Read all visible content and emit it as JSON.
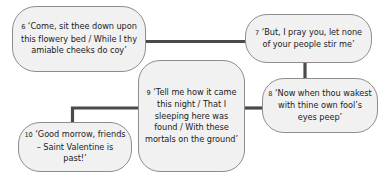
{
  "diagram": {
    "type": "flowchart",
    "title": "",
    "background_color": "#ffffff",
    "node_fill_color": "#f1f1f1",
    "node_border_color": "#8d8d8d",
    "connector_color": "#4a4a4a",
    "nodes": [
      {
        "id": "6",
        "number": "6",
        "quote": "‘Come, sit thee down upon this flowery bed / While I thy amiable cheeks do coy’",
        "lines": [
          "‘Come, sit thee down",
          "upon this flowery bed /",
          "While I thy amiable",
          "cheeks do coy’"
        ]
      },
      {
        "id": "7",
        "number": "7",
        "quote": "‘But, I pray you, let none of your people stir me’",
        "lines": [
          "‘But, I pray you, let",
          "none of your people",
          "stir me’"
        ]
      },
      {
        "id": "8",
        "number": "8",
        "quote": "‘Now when thou wakest with thine own fool’s eyes peep’",
        "lines": [
          "‘Now when thou",
          "wakest with thine",
          "own fool’s eyes peep’"
        ]
      },
      {
        "id": "9",
        "number": "9",
        "quote": "‘Tell me how it came this night / That I sleeping here was found / With these mortals on the ground’",
        "lines": [
          "‘Tell me how it came",
          "this night / That I",
          "sleeping here was",
          "found / With these",
          "mortals on the",
          "ground’"
        ]
      },
      {
        "id": "10",
        "number": "10",
        "quote": "‘Good morrow, friends – Saint Valentine is past!’",
        "lines": [
          "‘Good morrow,",
          "friends – Saint",
          "Valentine is past!’"
        ]
      }
    ],
    "connectors": [
      {
        "from": "6",
        "to": "7",
        "style": "straight-horizontal"
      },
      {
        "from": "7",
        "to": "8",
        "style": "straight-vertical"
      },
      {
        "from": "9",
        "to": "8",
        "style": "straight-horizontal"
      },
      {
        "from": "9",
        "to": "10",
        "style": "elbow"
      }
    ]
  }
}
